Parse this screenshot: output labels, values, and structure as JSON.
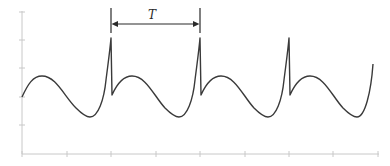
{
  "figure": {
    "period_label": "T",
    "colors": {
      "axis": "#c8c8c8",
      "wave": "#3a3a3a",
      "marker": "#2a2a2a",
      "background": "#ffffff"
    },
    "axes": {
      "y_ticks_count": 6,
      "x_ticks_count": 9,
      "tick_labels": []
    },
    "cycles_shown": 4,
    "period_marker": {
      "from_peak": 1,
      "to_peak": 2
    }
  }
}
